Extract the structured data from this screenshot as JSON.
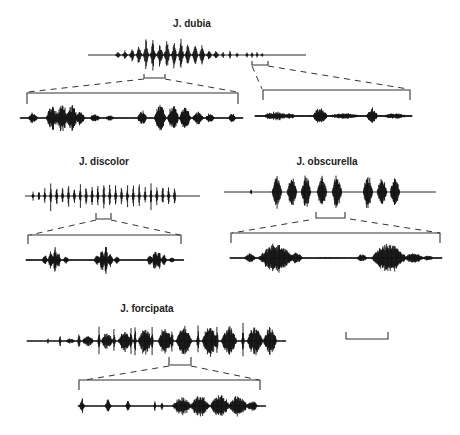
{
  "figure": {
    "type": "oscillogram-panel",
    "panels": [
      {
        "id": "dubia",
        "species_label": "J. dubia",
        "main_trace": {
          "pattern": "crescendo pulse train of ~11 large pulses followed by ~8 small rapid pulses"
        },
        "detail_traces": [
          {
            "pattern": "two pulse groups, each ~3-4 large pulses with trailing decay"
          },
          {
            "pattern": "three short buzz bursts with low-amplitude continuous noise"
          }
        ]
      },
      {
        "id": "discolor",
        "species_label": "J. discolor",
        "main_trace": {
          "pattern": "long uniform train of ~24 evenly spaced pulses"
        },
        "detail_traces": [
          {
            "pattern": "three clustered pulse groups"
          }
        ]
      },
      {
        "id": "obscurella",
        "species_label": "J. obscurella",
        "main_trace": {
          "pattern": "two groups of dense chirps (5 then 3)"
        },
        "detail_traces": [
          {
            "pattern": "two dense multi-pulse chirps"
          }
        ]
      },
      {
        "id": "forcipata",
        "species_label": "J. forcipata",
        "main_trace": {
          "pattern": "alternating clicks and dense buzz bursts increasing in amplitude"
        },
        "detail_traces": [
          {
            "pattern": "three isolated clicks followed by a long dense buzz"
          }
        ]
      }
    ],
    "scale_bar": {
      "label": ""
    }
  }
}
